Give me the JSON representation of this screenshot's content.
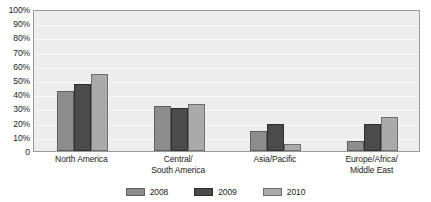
{
  "chart_data": {
    "type": "bar",
    "title": "",
    "subtitle": "",
    "xlabel": "",
    "ylabel": "",
    "ylim": [
      0,
      100
    ],
    "grid": true,
    "legend_position": "bottom",
    "categories": [
      "North America",
      "Central/\nSouth America",
      "Asia/Pacific",
      "Europe/Africa/\nMiddle East"
    ],
    "category_lines": [
      [
        "North America",
        ""
      ],
      [
        "Central/",
        "South America"
      ],
      [
        "Asia/Pacific",
        ""
      ],
      [
        "Europe/Africa/",
        "Middle East"
      ]
    ],
    "series": [
      {
        "name": "2008",
        "color": "#8d8d8d",
        "values": [
          42,
          32,
          14,
          7
        ]
      },
      {
        "name": "2009",
        "color": "#4b4b4b",
        "values": [
          47,
          30,
          19,
          19
        ]
      },
      {
        "name": "2010",
        "color": "#aaaaaa",
        "values": [
          54,
          33,
          5,
          24
        ]
      }
    ],
    "ytick_labels": [
      "100%",
      "90%",
      "80%",
      "70%",
      "60%",
      "50%",
      "40%",
      "30%",
      "20%",
      "10%",
      "0"
    ],
    "ytick_values": [
      100,
      90,
      80,
      70,
      60,
      50,
      40,
      30,
      20,
      10,
      0
    ],
    "colors": {
      "plot_background": "#ededed",
      "plot_border": "#9a9a9a",
      "gridline": "#fbfbfb",
      "text": "#1b1b1b",
      "page_background": "#ffffff"
    }
  }
}
